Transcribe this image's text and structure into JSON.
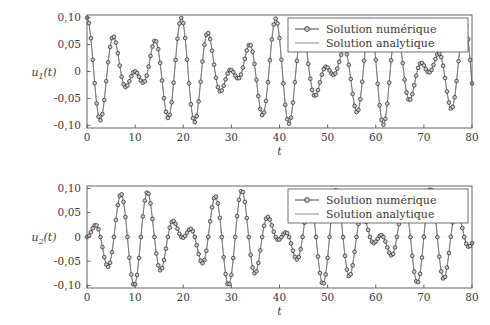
{
  "figure": {
    "background_color": "#ffffff",
    "foreground_color": "#3a3a3a",
    "frame_color": "#555555"
  },
  "legend": {
    "entries": [
      {
        "label": "Solution numérique",
        "style": "line-with-circle-marker",
        "color": "#444444",
        "marker_fill": "#c9c9c9"
      },
      {
        "label": "Solution analytique",
        "style": "line",
        "color": "#8a8a8a"
      }
    ],
    "position": "top-right",
    "border": true
  },
  "chart_data": [
    {
      "type": "line",
      "id": "subplot-u1",
      "title": "",
      "xlabel": "t",
      "ylabel": "u_1(t)",
      "ylabel_display": "u1(t)",
      "xlim": [
        0,
        80
      ],
      "ylim": [
        -0.105,
        0.105
      ],
      "xticks": [
        0,
        10,
        20,
        30,
        40,
        50,
        60,
        70,
        80
      ],
      "xticklabels": [
        "0",
        "10",
        "20",
        "30",
        "40",
        "50",
        "60",
        "70",
        "80"
      ],
      "yticks": [
        0.1,
        0.05,
        0,
        -0.05,
        -0.1
      ],
      "yticklabels": [
        "0,10",
        "0,05",
        "0",
        "-0,05",
        "-0,10"
      ],
      "grid": false,
      "legend_position": "top-right",
      "model": {
        "description": "Two coupled oscillators beat pattern; u1 = A*(cos(w1*t)+cos(w2*t))/2",
        "amplitude": 0.1,
        "omega_1": 0.9666,
        "omega_2": 1.2775,
        "phase_1": 0.0,
        "phase_2": 0.0,
        "form": "u1(t) = 0.05*cos(omega_1*t) + 0.05*cos(omega_2*t)"
      },
      "marker_step": 0.4,
      "series": [
        {
          "name": "Solution numérique",
          "marker": "circle",
          "sampled": true
        },
        {
          "name": "Solution analytique",
          "marker": "none",
          "sampled": false
        }
      ]
    },
    {
      "type": "line",
      "id": "subplot-u2",
      "title": "",
      "xlabel": "t",
      "ylabel": "u_2(t)",
      "ylabel_display": "u2(t)",
      "xlim": [
        0,
        80
      ],
      "ylim": [
        -0.105,
        0.105
      ],
      "xticks": [
        0,
        10,
        20,
        30,
        40,
        50,
        60,
        70,
        80
      ],
      "xticklabels": [
        "0",
        "10",
        "20",
        "30",
        "40",
        "50",
        "60",
        "70",
        "80"
      ],
      "yticks": [
        0.1,
        0.05,
        0,
        -0.05,
        -0.1
      ],
      "yticklabels": [
        "0,10",
        "0,05",
        "0",
        "-0,05",
        "-0,10"
      ],
      "grid": false,
      "legend_position": "top-right",
      "model": {
        "description": "Two coupled oscillators beat pattern, antiphase partner; u2 = A*(cos(w1*t)-cos(w2*t))/2",
        "amplitude": 0.1,
        "omega_1": 0.9666,
        "omega_2": 1.2775,
        "phase_1": 0.0,
        "phase_2": 0.0,
        "form": "u2(t) = 0.05*cos(omega_1*t) - 0.05*cos(omega_2*t)"
      },
      "marker_step": 0.4,
      "series": [
        {
          "name": "Solution numérique",
          "marker": "circle",
          "sampled": true
        },
        {
          "name": "Solution analytique",
          "marker": "none",
          "sampled": false
        }
      ]
    }
  ]
}
